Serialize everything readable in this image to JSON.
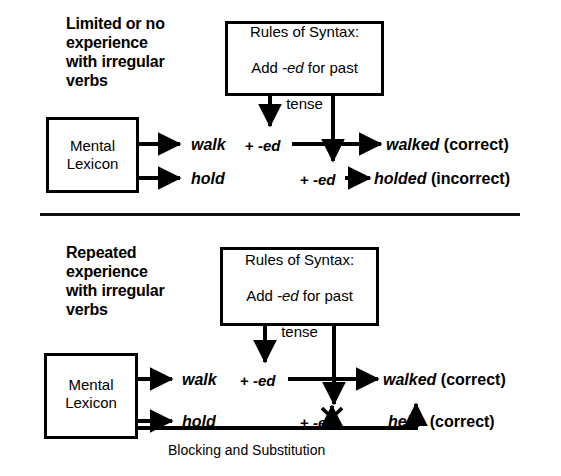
{
  "diagram": {
    "panels": [
      {
        "id": "limited-experience",
        "heading": "Limited or no\nexperience\nwith irregular\nverbs",
        "lexicon_box": "Mental\nLexicon",
        "rules_box": {
          "line1": "Rules of Syntax:",
          "line2_pre": "Add ",
          "line2_em": "-ed",
          "line2_post": " for past",
          "line3": "tense"
        },
        "rows": [
          {
            "verb": "walk",
            "suffix_plus": "+",
            "suffix_ed": "-ed",
            "result_word": "walked",
            "result_note": "(correct)"
          },
          {
            "verb": "hold",
            "suffix_plus": "+",
            "suffix_ed": "-ed",
            "result_word": "holded",
            "result_note": "(incorrect)"
          }
        ]
      },
      {
        "id": "repeated-experience",
        "heading": "Repeated\nexperience\nwith irregular\nverbs",
        "lexicon_box": "Mental\nLexicon",
        "rules_box": {
          "line1": "Rules of Syntax:",
          "line2_pre": "Add ",
          "line2_em": "-ed",
          "line2_post": " for past",
          "line3": "tense"
        },
        "rows": [
          {
            "verb": "walk",
            "suffix_plus": "+",
            "suffix_ed": "-ed",
            "result_word": "walked",
            "result_note": "(correct)"
          },
          {
            "verb": "hold",
            "suffix_plus": "+",
            "suffix_ed": "-ed",
            "suffix_struck": true,
            "result_word": "held",
            "result_note": "(correct)"
          }
        ],
        "feedback_label": "Blocking and Substitution"
      }
    ],
    "colors": {
      "ink": "#000000",
      "background": "#ffffff"
    }
  }
}
